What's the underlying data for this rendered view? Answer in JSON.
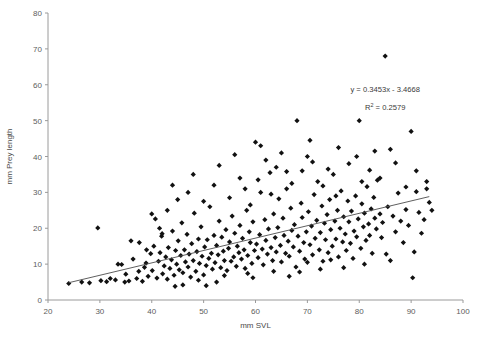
{
  "chart_data": {
    "type": "scatter",
    "title": "",
    "xlabel": "mm SVL",
    "ylabel": "mm Prey length",
    "xlim": [
      20,
      100
    ],
    "ylim": [
      0,
      80
    ],
    "xticks": [
      20,
      30,
      40,
      50,
      60,
      70,
      80,
      90,
      100
    ],
    "yticks": [
      0,
      10,
      20,
      30,
      40,
      50,
      60,
      70,
      80
    ],
    "grid": false,
    "legend": null,
    "annotations": [
      {
        "name": "regression-equation",
        "text": "y = 0.3453x - 3.4668",
        "x": 85,
        "y": 58
      },
      {
        "name": "r-squared",
        "text": "R",
        "sup": "2",
        "text2": " = 0.2579",
        "x": 85,
        "y": 53
      }
    ],
    "trendline": {
      "name": "linear-regression-line",
      "slope": 0.3453,
      "intercept": -3.4668,
      "x_start": 24.0,
      "x_end": 93.5,
      "y_start": 4.82,
      "y_end": 28.82
    },
    "series": [
      {
        "name": "prey length vs SVL",
        "marker": "diamond",
        "color": "#111111",
        "points": [
          [
            24.0,
            4.6
          ],
          [
            26.5,
            5.0
          ],
          [
            29.6,
            20.1
          ],
          [
            30.2,
            5.4
          ],
          [
            31.3,
            5.1
          ],
          [
            33.0,
            5.6
          ],
          [
            34.2,
            9.9
          ],
          [
            34.8,
            5.0
          ],
          [
            35.6,
            5.3
          ],
          [
            36.4,
            11.4
          ],
          [
            37.1,
            6.0
          ],
          [
            37.6,
            16.0
          ],
          [
            38.2,
            5.2
          ],
          [
            38.6,
            9.1
          ],
          [
            38.9,
            10.3
          ],
          [
            39.3,
            6.6
          ],
          [
            39.8,
            12.9
          ],
          [
            40.1,
            8.2
          ],
          [
            40.4,
            15.0
          ],
          [
            40.7,
            22.6
          ],
          [
            41.0,
            6.1
          ],
          [
            41.3,
            10.8
          ],
          [
            41.6,
            13.2
          ],
          [
            41.9,
            17.8
          ],
          [
            42.1,
            7.3
          ],
          [
            42.4,
            9.5
          ],
          [
            42.7,
            12.0
          ],
          [
            43.0,
            5.8
          ],
          [
            43.2,
            14.6
          ],
          [
            43.5,
            8.8
          ],
          [
            43.8,
            11.2
          ],
          [
            44.0,
            19.2
          ],
          [
            44.3,
            6.9
          ],
          [
            44.6,
            13.8
          ],
          [
            44.8,
            10.0
          ],
          [
            45.1,
            16.5
          ],
          [
            45.3,
            8.4
          ],
          [
            45.6,
            12.4
          ],
          [
            45.8,
            21.5
          ],
          [
            46.0,
            7.6
          ],
          [
            46.3,
            14.0
          ],
          [
            46.5,
            10.6
          ],
          [
            46.8,
            18.3
          ],
          [
            47.0,
            9.2
          ],
          [
            47.2,
            12.8
          ],
          [
            47.5,
            6.4
          ],
          [
            47.7,
            15.7
          ],
          [
            48.0,
            11.0
          ],
          [
            48.2,
            24.2
          ],
          [
            48.5,
            8.0
          ],
          [
            48.7,
            13.5
          ],
          [
            49.0,
            17.0
          ],
          [
            49.2,
            10.2
          ],
          [
            49.5,
            20.4
          ],
          [
            49.7,
            12.2
          ],
          [
            50.0,
            7.0
          ],
          [
            50.2,
            14.8
          ],
          [
            50.5,
            9.6
          ],
          [
            50.7,
            16.8
          ],
          [
            51.0,
            11.6
          ],
          [
            51.2,
            26.0
          ],
          [
            51.5,
            13.0
          ],
          [
            51.7,
            8.6
          ],
          [
            52.0,
            18.0
          ],
          [
            52.2,
            10.4
          ],
          [
            52.5,
            15.2
          ],
          [
            52.8,
            12.6
          ],
          [
            53.0,
            22.0
          ],
          [
            53.3,
            9.0
          ],
          [
            53.5,
            17.5
          ],
          [
            53.8,
            13.6
          ],
          [
            54.0,
            11.0
          ],
          [
            54.3,
            19.6
          ],
          [
            54.5,
            8.2
          ],
          [
            54.8,
            14.4
          ],
          [
            55.0,
            16.2
          ],
          [
            55.3,
            10.8
          ],
          [
            55.5,
            23.4
          ],
          [
            55.8,
            12.0
          ],
          [
            56.0,
            18.6
          ],
          [
            56.3,
            9.4
          ],
          [
            56.5,
            15.0
          ],
          [
            56.8,
            13.2
          ],
          [
            57.0,
            20.8
          ],
          [
            57.3,
            11.4
          ],
          [
            57.5,
            17.2
          ],
          [
            57.8,
            14.0
          ],
          [
            58.0,
            8.8
          ],
          [
            58.3,
            25.0
          ],
          [
            58.5,
            12.4
          ],
          [
            58.8,
            19.0
          ],
          [
            59.0,
            16.0
          ],
          [
            59.3,
            10.2
          ],
          [
            59.5,
            21.8
          ],
          [
            59.8,
            13.8
          ],
          [
            60.0,
            44.0
          ],
          [
            60.2,
            15.6
          ],
          [
            60.5,
            11.8
          ],
          [
            60.8,
            18.2
          ],
          [
            61.0,
            30.0
          ],
          [
            61.3,
            14.2
          ],
          [
            61.5,
            9.8
          ],
          [
            61.8,
            22.4
          ],
          [
            62.0,
            16.6
          ],
          [
            62.3,
            12.8
          ],
          [
            62.5,
            19.8
          ],
          [
            62.8,
            35.5
          ],
          [
            63.0,
            14.6
          ],
          [
            63.3,
            11.0
          ],
          [
            63.5,
            24.0
          ],
          [
            63.8,
            17.4
          ],
          [
            64.0,
            13.4
          ],
          [
            64.3,
            20.2
          ],
          [
            64.5,
            28.2
          ],
          [
            64.8,
            15.2
          ],
          [
            65.0,
            10.6
          ],
          [
            65.3,
            22.8
          ],
          [
            65.5,
            18.0
          ],
          [
            65.8,
            13.0
          ],
          [
            66.0,
            31.0
          ],
          [
            66.3,
            16.4
          ],
          [
            66.5,
            12.2
          ],
          [
            66.8,
            25.6
          ],
          [
            67.0,
            19.4
          ],
          [
            67.3,
            14.8
          ],
          [
            67.5,
            21.0
          ],
          [
            67.8,
            9.2
          ],
          [
            68.0,
            50.0
          ],
          [
            68.2,
            17.8
          ],
          [
            68.5,
            13.6
          ],
          [
            68.8,
            27.0
          ],
          [
            69.0,
            23.0
          ],
          [
            69.3,
            16.0
          ],
          [
            69.5,
            11.4
          ],
          [
            69.8,
            19.0
          ],
          [
            70.0,
            40.0
          ],
          [
            70.2,
            24.6
          ],
          [
            70.5,
            15.4
          ],
          [
            70.8,
            20.6
          ],
          [
            71.0,
            12.6
          ],
          [
            71.3,
            29.4
          ],
          [
            71.5,
            17.2
          ],
          [
            71.8,
            22.2
          ],
          [
            72.0,
            33.0
          ],
          [
            72.3,
            14.0
          ],
          [
            72.5,
            18.8
          ],
          [
            72.8,
            26.2
          ],
          [
            73.0,
            10.8
          ],
          [
            73.3,
            21.4
          ],
          [
            73.5,
            16.8
          ],
          [
            73.8,
            23.8
          ],
          [
            74.0,
            13.2
          ],
          [
            74.3,
            28.0
          ],
          [
            74.5,
            19.6
          ],
          [
            74.8,
            15.0
          ],
          [
            75.0,
            35.0
          ],
          [
            75.3,
            22.0
          ],
          [
            75.5,
            17.0
          ],
          [
            75.8,
            25.0
          ],
          [
            76.0,
            12.0
          ],
          [
            76.3,
            20.0
          ],
          [
            76.5,
            30.4
          ],
          [
            76.8,
            16.2
          ],
          [
            77.0,
            23.2
          ],
          [
            77.3,
            18.4
          ],
          [
            77.5,
            13.8
          ],
          [
            77.8,
            27.6
          ],
          [
            78.0,
            21.8
          ],
          [
            78.3,
            15.8
          ],
          [
            78.5,
            24.8
          ],
          [
            78.8,
            11.6
          ],
          [
            79.0,
            19.2
          ],
          [
            79.3,
            29.0
          ],
          [
            79.5,
            17.6
          ],
          [
            79.8,
            22.6
          ],
          [
            80.0,
            50.0
          ],
          [
            80.3,
            14.4
          ],
          [
            80.5,
            26.8
          ],
          [
            80.8,
            20.4
          ],
          [
            81.0,
            24.2
          ],
          [
            81.3,
            16.6
          ],
          [
            81.5,
            31.6
          ],
          [
            81.8,
            21.2
          ],
          [
            82.0,
            18.0
          ],
          [
            82.3,
            25.4
          ],
          [
            82.5,
            13.0
          ],
          [
            82.8,
            28.6
          ],
          [
            83.0,
            22.8
          ],
          [
            83.3,
            19.8
          ],
          [
            83.5,
            33.4
          ],
          [
            84.0,
            24.0
          ],
          [
            84.3,
            17.4
          ],
          [
            84.5,
            21.6
          ],
          [
            85.0,
            68.0
          ],
          [
            85.2,
            12.8
          ],
          [
            85.5,
            26.0
          ],
          [
            86.0,
            42.0
          ],
          [
            86.5,
            23.4
          ],
          [
            87.0,
            19.0
          ],
          [
            87.5,
            29.8
          ],
          [
            88.0,
            22.0
          ],
          [
            88.5,
            16.0
          ],
          [
            89.0,
            25.2
          ],
          [
            89.5,
            20.8
          ],
          [
            90.0,
            47.0
          ],
          [
            90.3,
            6.2
          ],
          [
            90.6,
            13.4
          ],
          [
            91.0,
            30.2
          ],
          [
            91.5,
            24.4
          ],
          [
            92.0,
            18.6
          ],
          [
            92.5,
            22.4
          ],
          [
            93.0,
            31.0
          ],
          [
            93.5,
            27.2
          ],
          [
            94.0,
            25.0
          ],
          [
            43.0,
            25.0
          ],
          [
            45.0,
            28.0
          ],
          [
            47.0,
            30.0
          ],
          [
            50.0,
            27.5
          ],
          [
            52.0,
            32.0
          ],
          [
            55.0,
            28.5
          ],
          [
            57.0,
            34.0
          ],
          [
            59.0,
            26.5
          ],
          [
            62.0,
            39.0
          ],
          [
            64.0,
            37.0
          ],
          [
            66.0,
            35.8
          ],
          [
            69.0,
            36.0
          ],
          [
            71.0,
            38.5
          ],
          [
            74.0,
            36.5
          ],
          [
            78.0,
            38.0
          ],
          [
            82.0,
            36.2
          ],
          [
            84.0,
            34.0
          ],
          [
            40.0,
            24.0
          ],
          [
            41.5,
            20.0
          ],
          [
            36.0,
            16.5
          ],
          [
            33.5,
            10.0
          ],
          [
            44.0,
            32.0
          ],
          [
            48.0,
            35.0
          ],
          [
            53.0,
            37.5
          ],
          [
            56.0,
            40.5
          ],
          [
            61.0,
            43.0
          ],
          [
            65.0,
            41.0
          ],
          [
            70.5,
            44.5
          ],
          [
            76.0,
            42.5
          ],
          [
            79.5,
            40.0
          ],
          [
            83.0,
            41.5
          ],
          [
            87.0,
            38.2
          ],
          [
            91.0,
            36.0
          ],
          [
            93.0,
            33.0
          ],
          [
            89.0,
            31.5
          ],
          [
            58.0,
            31.0
          ],
          [
            60.5,
            33.5
          ],
          [
            63.0,
            29.5
          ],
          [
            67.0,
            32.5
          ],
          [
            73.0,
            31.8
          ],
          [
            75.5,
            29.0
          ],
          [
            80.5,
            33.0
          ],
          [
            42.0,
            18.5
          ],
          [
            39.0,
            14.0
          ],
          [
            37.5,
            8.0
          ],
          [
            35.0,
            7.2
          ],
          [
            32.0,
            6.0
          ],
          [
            28.0,
            4.8
          ],
          [
            46.0,
            4.2
          ],
          [
            49.0,
            5.5
          ],
          [
            54.0,
            6.8
          ],
          [
            58.5,
            7.4
          ],
          [
            63.5,
            8.0
          ],
          [
            68.5,
            7.8
          ],
          [
            72.5,
            8.6
          ],
          [
            77.0,
            9.0
          ],
          [
            81.0,
            10.0
          ],
          [
            86.0,
            11.0
          ],
          [
            50.5,
            4.0
          ],
          [
            44.5,
            3.8
          ],
          [
            52.5,
            5.0
          ],
          [
            59.5,
            6.2
          ],
          [
            66.5,
            6.6
          ],
          [
            70.0,
            10.5
          ],
          [
            74.5,
            11.2
          ]
        ]
      }
    ]
  }
}
